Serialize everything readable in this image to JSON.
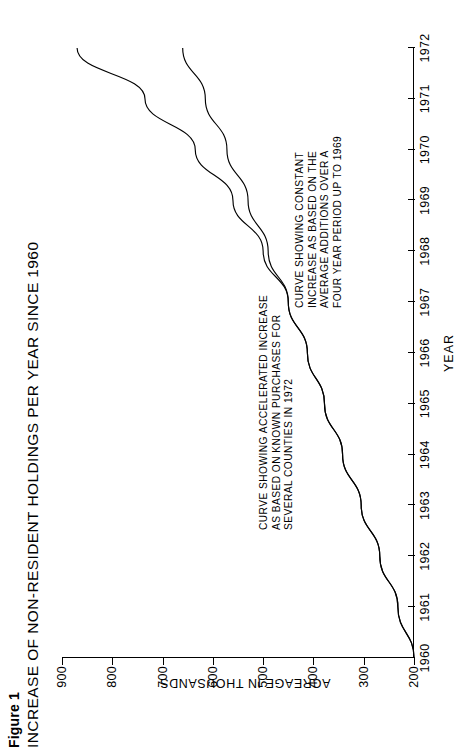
{
  "figure": {
    "number": "Figure 1",
    "title": "INCREASE OF NON-RESIDENT HOLDINGS PER YEAR SINCE 1960"
  },
  "chart_data": {
    "type": "line",
    "title": "INCREASE OF NON-RESIDENT HOLDINGS PER YEAR SINCE 1960",
    "xlabel": "YEAR",
    "ylabel": "ACREAGE IN THOUSANDS",
    "xlim": [
      1960,
      1972
    ],
    "ylim": [
      200,
      900
    ],
    "grid": false,
    "legend_position": "none",
    "x_ticks": [
      "1960",
      "1961",
      "1962",
      "1963",
      "1964",
      "1965",
      "1966",
      "1967",
      "1968",
      "1969",
      "1970",
      "1971",
      "1972"
    ],
    "y_ticks": [
      "200",
      "300",
      "400",
      "500",
      "600",
      "700",
      "800",
      "900"
    ],
    "x": [
      1960,
      1961,
      1962,
      1963,
      1964,
      1965,
      1966,
      1967,
      1968,
      1969,
      1970,
      1971,
      1972
    ],
    "series": [
      {
        "name": "CURVE SHOWING ACCELERATED INCREASE AS BASED ON KNOWN PURCHASES FOR SEVERAL COUNTIES IN 1972",
        "values": [
          200,
          232,
          268,
          305,
          342,
          378,
          412,
          450,
          500,
          560,
          635,
          735,
          870
        ]
      },
      {
        "name": "CURVE SHOWING CONSTANT INCREASE AS BASED ON THE AVERAGE ADDITIONS OVER A FOUR YEAR PERIOD UP TO 1969",
        "values": [
          200,
          232,
          268,
          305,
          342,
          378,
          412,
          450,
          490,
          530,
          572,
          615,
          660
        ]
      }
    ],
    "annotations": [
      {
        "id": "accelerated-curve-note",
        "lines": [
          "CURVE SHOWING ACCELERATED INCREASE",
          "AS BASED ON KNOWN PURCHASES FOR",
          "SEVERAL COUNTIES IN 1972"
        ]
      },
      {
        "id": "constant-curve-note",
        "lines": [
          "CURVE SHOWING CONSTANT",
          "INCREASE AS BASED ON THE",
          "AVERAGE ADDITIONS OVER A",
          "FOUR YEAR PERIOD UP TO 1969"
        ]
      }
    ]
  },
  "colors": {
    "ink": "#000000",
    "background": "#ffffff"
  }
}
